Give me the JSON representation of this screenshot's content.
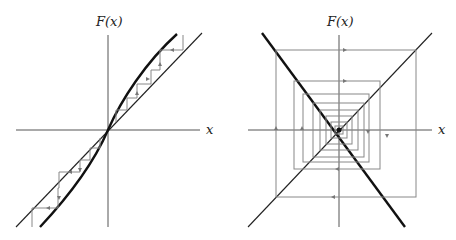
{
  "panels": [
    {
      "id": "left",
      "y_axis_label": "F(x)",
      "x_axis_label": "x",
      "description": "Cobweb diagram: thick curve F(x) steeper than diagonal at origin; iterates move away from fixed point at origin (unstable)"
    },
    {
      "id": "right",
      "y_axis_label": "F(x)",
      "x_axis_label": "x",
      "description": "Cobweb diagram: thick line F(x) with negative slope steeper than -1; iterates spiral outward from fixed point at origin (unstable oscillation)"
    }
  ],
  "colors": {
    "curve": "#111111",
    "diagonal": "#222222",
    "axes": "#555555",
    "cobweb": "#888888"
  }
}
